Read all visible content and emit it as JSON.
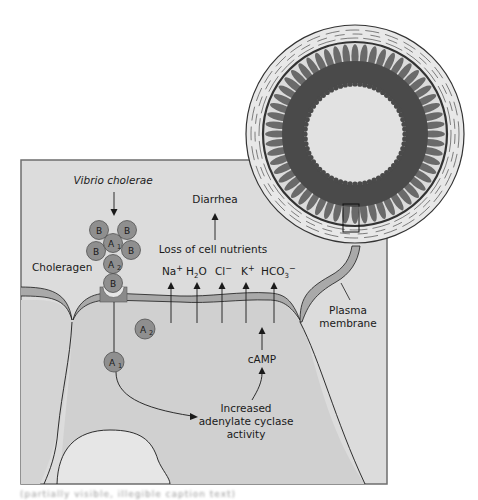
{
  "figure": {
    "colors": {
      "panel_bg": "#d9d9d9",
      "panel_border": "#6e6e6e",
      "cell_fill": "#cfcfcf",
      "nucleus_fill": "#e4e4e4",
      "membrane_fill": "#a9a9a9",
      "toxin_fill": "#8f8f8f",
      "receptor_fill": "#8a8a8a",
      "villi_dark": "#4a4a4a",
      "villi_mid": "#6a6a6a",
      "lumen_fill": "#e2e2e2",
      "ring_fill": "#e6e6e6",
      "line": "#1a1a1a"
    },
    "labels": {
      "organism": "Vibrio cholerae",
      "toxin": "Choleragen",
      "outcome": "Diarrhea",
      "loss": "Loss of cell nutrients",
      "membrane": "Plasma membrane",
      "membrane_line1": "Plasma",
      "membrane_line2": "membrane",
      "second_messenger": "cAMP",
      "enzyme_line1": "Increased",
      "enzyme_line2": "adenylate cyclase",
      "enzyme_line3": "activity"
    },
    "ions": [
      {
        "base": "Na",
        "sub": "",
        "sup": "+"
      },
      {
        "base": "H",
        "sub": "2",
        "tail": "O",
        "sup": ""
      },
      {
        "base": "Cl",
        "sub": "",
        "sup": "−"
      },
      {
        "base": "K",
        "sub": "",
        "sup": "+"
      },
      {
        "base": "HCO",
        "sub": "3",
        "sup": "−"
      }
    ],
    "toxin_subunits": {
      "B": "B",
      "A": "A",
      "A1_sub": "1",
      "A2_sub": "2"
    },
    "inset": {
      "description": "Cross-section of small intestine with villi; boxed region enlarged below"
    },
    "caption": "(partially visible, illegible caption text)"
  }
}
